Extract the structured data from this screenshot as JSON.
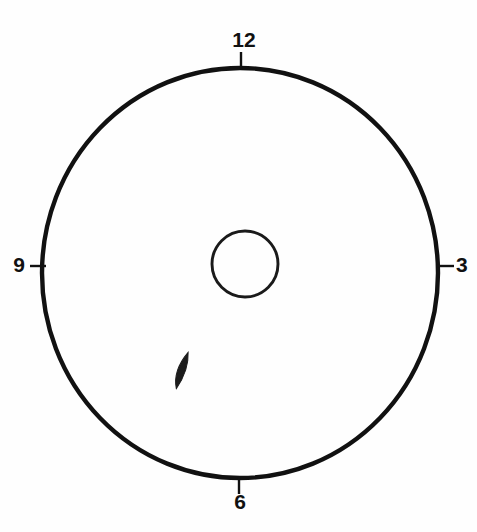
{
  "figure": {
    "kind": "clock-face-circle-diagram",
    "background_color": "#fefefe",
    "ink_color": "#111111",
    "width": 477,
    "height": 532
  },
  "outer_circle": {
    "name": "outer-boundary-circle",
    "center_x": 240,
    "center_y": 273,
    "radius_x": 198,
    "radius_y": 205,
    "stroke_width": 4.4,
    "fill": "none"
  },
  "inner_circle": {
    "name": "inner-center-circle",
    "center_x": 245,
    "center_y": 264,
    "radius": 33,
    "stroke_width": 2.9,
    "fill": "none"
  },
  "lesion": {
    "name": "dark-lens-marker",
    "center_x": 181,
    "center_y": 370,
    "length": 38,
    "width": 15,
    "rotation_deg": 22,
    "color": "#1c1c1c"
  },
  "hour_markers": [
    {
      "label": "12",
      "position": "top",
      "label_x": 244,
      "label_y": 41,
      "text_anchor": "middle",
      "tick_x1": 241,
      "tick_y1": 52,
      "tick_x2": 241,
      "tick_y2": 70
    },
    {
      "label": "3",
      "position": "right",
      "label_x": 456,
      "label_y": 266,
      "text_anchor": "start",
      "tick_x1": 436,
      "tick_y1": 266,
      "tick_x2": 454,
      "tick_y2": 266
    },
    {
      "label": "6",
      "position": "bottom",
      "label_x": 240,
      "label_y": 503,
      "text_anchor": "middle",
      "tick_x1": 239,
      "tick_y1": 477,
      "tick_x2": 239,
      "tick_y2": 494
    },
    {
      "label": "9",
      "position": "left",
      "label_x": 25,
      "label_y": 266,
      "text_anchor": "end",
      "tick_x1": 30,
      "tick_y1": 266,
      "tick_x2": 46,
      "tick_y2": 266
    }
  ]
}
